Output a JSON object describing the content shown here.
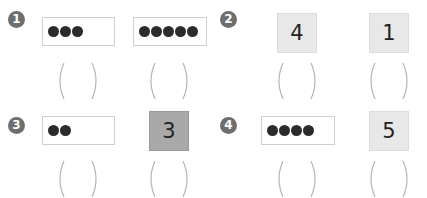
{
  "problems": [
    {
      "number": "1",
      "items": [
        {
          "type": "dots",
          "count": 3,
          "label": "●●●"
        },
        {
          "type": "dots",
          "count": 5,
          "label": "●●●●●"
        }
      ],
      "answers": [
        "",
        ""
      ]
    },
    {
      "number": "2",
      "items": [
        {
          "type": "numeral",
          "value": "4"
        },
        {
          "type": "numeral",
          "value": "1"
        }
      ],
      "answers": [
        "",
        ""
      ]
    },
    {
      "number": "3",
      "items": [
        {
          "type": "dots",
          "count": 2,
          "label": "●●"
        },
        {
          "type": "numeral",
          "value": "3"
        }
      ],
      "answers": [
        "",
        ""
      ]
    },
    {
      "number": "4",
      "items": [
        {
          "type": "dots",
          "count": 4,
          "label": "●●●●"
        },
        {
          "type": "numeral",
          "value": "5"
        }
      ],
      "answers": [
        "",
        ""
      ]
    }
  ],
  "colors": {
    "badge": "#6e6e6e",
    "dot": "#2b2b2b",
    "tile_light": "#e8e8e8",
    "tile_dark": "#a9a9a9",
    "paren": "#b5b5b5"
  }
}
